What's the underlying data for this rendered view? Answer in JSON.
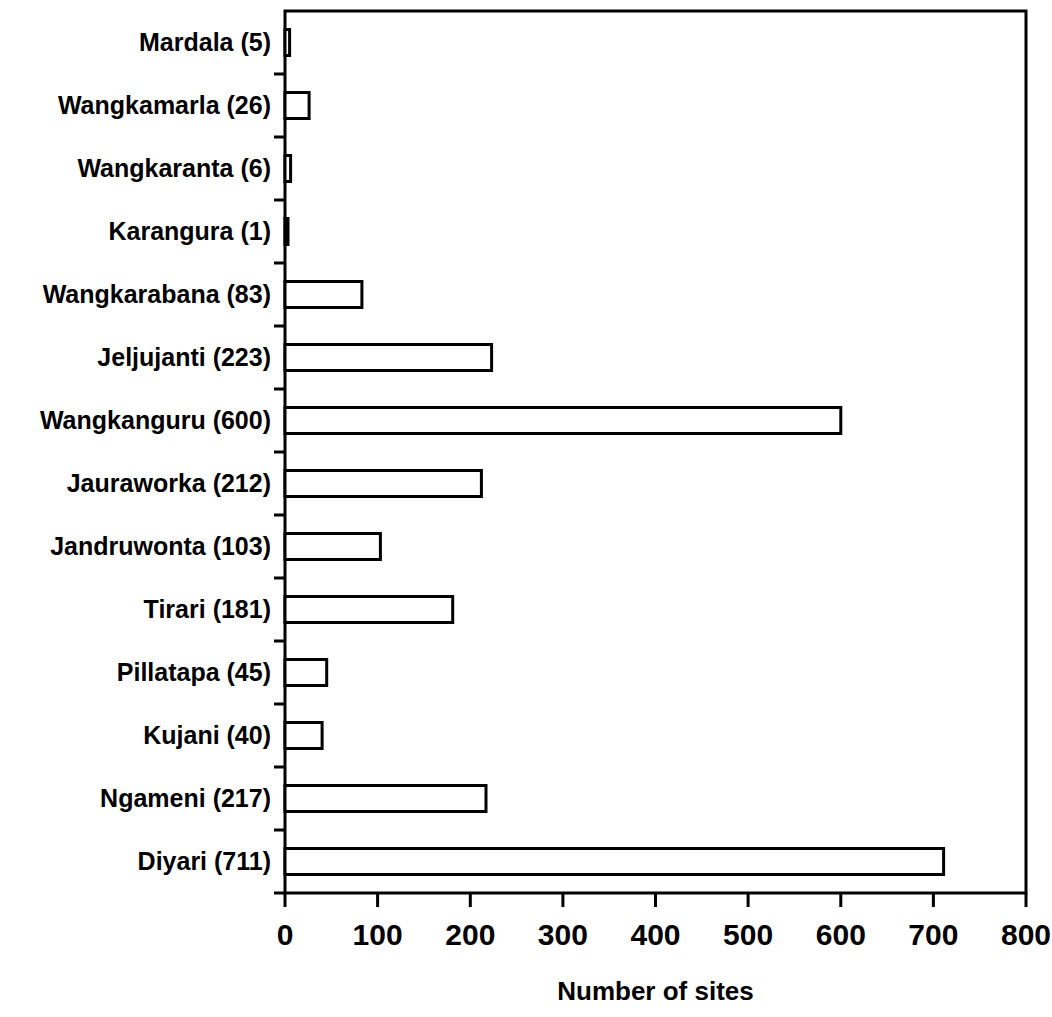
{
  "chart_data": {
    "type": "bar",
    "orientation": "horizontal",
    "title": "",
    "xlabel": "Number of sites",
    "ylabel": "",
    "xlim": [
      0,
      800
    ],
    "xticks": [
      0,
      100,
      200,
      300,
      400,
      500,
      600,
      700,
      800
    ],
    "xtick_labels": [
      "0",
      "100",
      "200",
      "300",
      "400",
      "500",
      "600",
      "700",
      "800"
    ],
    "grid": false,
    "legend": null,
    "bar_style": {
      "fill": "#ffffff",
      "edge": "#000000"
    },
    "categories": [
      "Mardala (5)",
      "Wangkamarla (26)",
      "Wangkaranta (6)",
      "Karangura (1)",
      "Wangkarabana (83)",
      "Jeljujanti (223)",
      "Wangkanguru (600)",
      "Jauraworka (212)",
      "Jandruwonta (103)",
      "Tirari (181)",
      "Pillatapa (45)",
      "Kujani (40)",
      "Ngameni (217)",
      "Diyari (711)"
    ],
    "category_names": [
      "Mardala",
      "Wangkamarla",
      "Wangkaranta",
      "Karangura",
      "Wangkarabana",
      "Jeljujanti",
      "Wangkanguru",
      "Jauraworka",
      "Jandruwonta",
      "Tirari",
      "Pillatapa",
      "Kujani",
      "Ngameni",
      "Diyari"
    ],
    "values": [
      5,
      26,
      6,
      1,
      83,
      223,
      600,
      212,
      103,
      181,
      45,
      40,
      217,
      711
    ]
  }
}
